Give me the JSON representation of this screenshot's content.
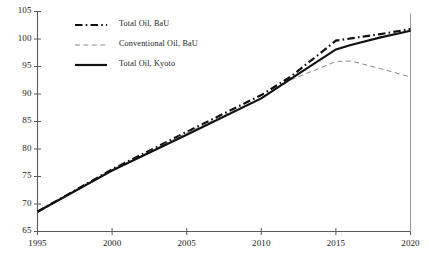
{
  "chart_data": {
    "type": "line",
    "title": "",
    "xlabel": "",
    "ylabel": "",
    "xlim": [
      1995,
      2020
    ],
    "ylim": [
      65,
      105
    ],
    "xticks": [
      1995,
      2000,
      2005,
      2010,
      2015,
      2020
    ],
    "yticks": [
      65,
      70,
      75,
      80,
      85,
      90,
      95,
      100,
      105
    ],
    "xtick_labels": [
      "1995",
      "2000",
      "2005",
      "2010",
      "2015",
      "2020"
    ],
    "ytick_labels": [
      "65",
      "70",
      "75",
      "80",
      "85",
      "90",
      "95",
      "100",
      "105"
    ],
    "grid": false,
    "legend_position": "upper-left-inside",
    "x": [
      1995,
      2000,
      2005,
      2010,
      2012,
      2015,
      2016,
      2018,
      2020
    ],
    "series": [
      {
        "name": "Total Oil, BaU",
        "style": "dash-dot",
        "color": "#111111",
        "width": 2.2,
        "values": [
          68.6,
          76.3,
          83.1,
          89.8,
          93.2,
          99.7,
          100.1,
          100.9,
          101.8
        ]
      },
      {
        "name": "Conventional Oil, BaU",
        "style": "dashed",
        "color": "#8a8a8a",
        "width": 1.0,
        "values": [
          68.6,
          76.1,
          82.9,
          89.3,
          92.6,
          95.9,
          96.0,
          94.6,
          93.1
        ]
      },
      {
        "name": "Total Oil, Kyoto",
        "style": "solid",
        "color": "#111111",
        "width": 2.2,
        "values": [
          68.6,
          76.1,
          82.6,
          89.2,
          92.8,
          98.1,
          98.9,
          100.3,
          101.5
        ]
      }
    ]
  },
  "legend": {
    "entries": [
      {
        "label": "Total Oil, BaU"
      },
      {
        "label": "Conventional Oil, BaU"
      },
      {
        "label": "Total Oil, Kyoto"
      }
    ]
  },
  "axis": {
    "line_color": "#5a5a5a",
    "text_color": "#1a1a1a"
  }
}
